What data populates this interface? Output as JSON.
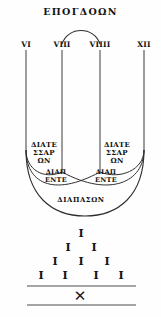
{
  "figure": {
    "title": "ΕΠΟΓΔΟΩΝ",
    "numerals": [
      {
        "label": "VI",
        "x": 26,
        "line_x": 26,
        "line_top": 50,
        "line_bottom": 148
      },
      {
        "label": "VIII",
        "x": 62,
        "line_x": 62,
        "line_top": 50,
        "line_bottom": 170
      },
      {
        "label": "VIIII",
        "x": 100,
        "line_x": 100,
        "line_top": 50,
        "line_bottom": 170
      },
      {
        "label": "XII",
        "x": 144,
        "line_x": 144,
        "line_top": 50,
        "line_bottom": 148
      }
    ],
    "interval_labels": [
      {
        "id": "diatessaron-left",
        "lines": [
          "ΔΙΑΤΕ",
          "ΣΣΑΡ",
          "ΩΝ"
        ],
        "x": 44,
        "y": 141
      },
      {
        "id": "diatessaron-right",
        "lines": [
          "ΔΙΑΤΕ",
          "ΣΣΑΡ",
          "ΩΝ"
        ],
        "x": 117,
        "y": 141
      },
      {
        "id": "diapente-left",
        "lines": [
          "ΔΙΑΠ",
          "ΕΝΤΕ"
        ],
        "x": 56,
        "y": 169
      },
      {
        "id": "diapente-right",
        "lines": [
          "ΔΙΑΠ",
          "ΕΝΤΕ"
        ],
        "x": 106,
        "y": 169
      },
      {
        "id": "diapason",
        "lines": [
          "ΔΙΑΠΑΣΩΝ"
        ],
        "x": 81,
        "y": 196
      }
    ],
    "tally_pyramid": {
      "glyph": "I",
      "rows": [
        {
          "count": 1,
          "y": 228,
          "xs": [
            81
          ]
        },
        {
          "count": 2,
          "y": 242,
          "xs": [
            68,
            94
          ]
        },
        {
          "count": 3,
          "y": 256,
          "xs": [
            55,
            81,
            107
          ]
        },
        {
          "count": 4,
          "y": 270,
          "xs": [
            41,
            65,
            96,
            121
          ]
        }
      ]
    },
    "footer": {
      "x_symbol": "✕",
      "x_symbol_x": 80,
      "x_symbol_y": 290,
      "rule_top_y": 286,
      "rule_bottom_y": 305,
      "rule_left": 27,
      "rule_right": 136
    },
    "colors": {
      "ink": "#111111",
      "stroke": "#3a3a3a",
      "background": "#fefefe"
    }
  }
}
